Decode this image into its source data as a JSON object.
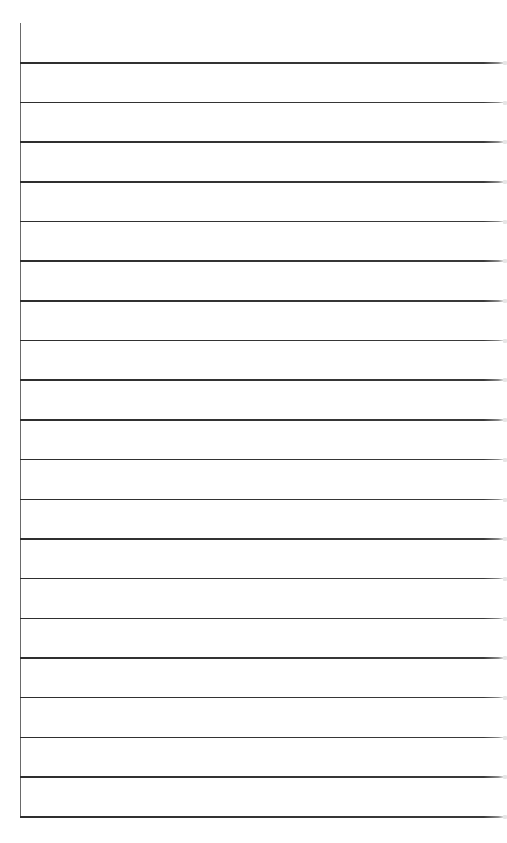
{
  "page": {
    "type": "lined-paper",
    "background_color": "#ffffff",
    "line_color": "#333333",
    "margin_line_color": "#6a6a6a",
    "line_count": 20,
    "first_line_y": 62,
    "last_line_y": 816,
    "line_spacing": 39.68
  }
}
